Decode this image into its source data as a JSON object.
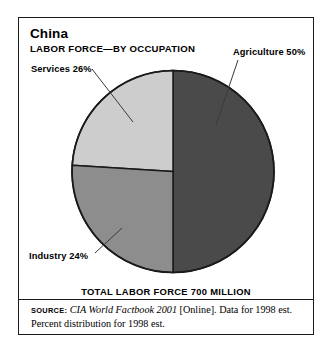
{
  "figure": {
    "title": "China",
    "subtitle": "LABOR FORCE—BY OCCUPATION",
    "total_caption": "TOTAL LABOR FORCE 700 MILLION",
    "source": {
      "kicker": "Source:",
      "work": "CIA World Factbook 2001",
      "rest": " [Online]. Data for 1998 est. Percent distribution for 1998 est."
    },
    "labels": {
      "agriculture": "Agriculture 50%",
      "services": "Services 26%",
      "industry": "Industry 24%"
    }
  },
  "chart_data": {
    "type": "pie",
    "title": "China",
    "subtitle": "LABOR FORCE—BY OCCUPATION",
    "unit": "percent",
    "total_label": "TOTAL LABOR FORCE 700 MILLION",
    "total_value": 700,
    "total_unit": "million workers",
    "year": "1998 est.",
    "categories": [
      "Agriculture",
      "Services",
      "Industry"
    ],
    "values": [
      50,
      26,
      24
    ],
    "labels": [
      "Agriculture 50%",
      "Services 26%",
      "Industry 24%"
    ],
    "colors": [
      "#4a4a4a",
      "#8d8d8d",
      "#cdcdcd"
    ],
    "start_angle_deg": 0,
    "direction": "clockwise",
    "legend": "none",
    "grid": false,
    "annotations": [
      "Agriculture 50%",
      "Services 26%",
      "Industry 24%"
    ]
  },
  "geometry": {
    "cx": 173,
    "cy": 171.5,
    "r": 101,
    "stroke": "#1a1a1a",
    "leader_stroke": "#3a3a3a"
  }
}
